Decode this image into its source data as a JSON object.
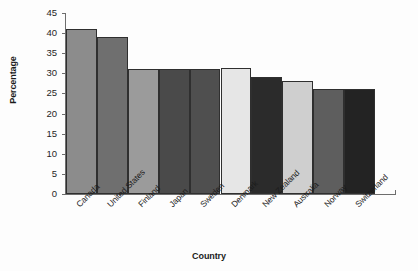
{
  "chart_data": {
    "type": "bar",
    "title": "",
    "subtitle": "",
    "xlabel": "Country",
    "ylabel": "Percentage",
    "categories": [
      "Canada",
      "United States",
      "Finland",
      "Japan",
      "Sweden",
      "Denmark",
      "New Zealand",
      "Australia",
      "Norway",
      "Switzerland"
    ],
    "values": [
      41,
      39,
      31,
      31,
      31,
      31.3,
      29,
      28,
      26,
      26.2
    ],
    "bar_colors": [
      "#8c8c8c",
      "#6f6f6f",
      "#9b9b9b",
      "#4a4a4a",
      "#4f4f4f",
      "#e6e6e6",
      "#2b2b2b",
      "#cfcfcf",
      "#5e5e5e",
      "#232323"
    ],
    "ylim": [
      0,
      45
    ],
    "yticks": [
      0,
      5,
      10,
      15,
      20,
      25,
      30,
      35,
      40,
      45
    ],
    "ytick_labels": [
      "0",
      "5",
      "10",
      "15",
      "20",
      "25",
      "30",
      "35",
      "40",
      "45"
    ],
    "grid": false,
    "legend": "none",
    "axis_color": "#6d6d6d",
    "text_color": "#1b1b1b"
  }
}
